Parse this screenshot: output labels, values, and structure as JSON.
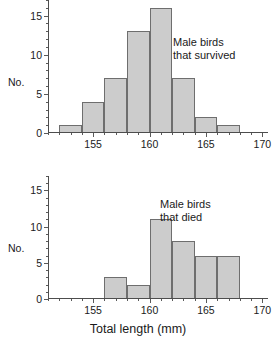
{
  "figure": {
    "xlabel": "Total length (mm)"
  },
  "chart_data": [
    {
      "type": "bar",
      "title": "",
      "annotation": [
        "Male birds",
        "that survived"
      ],
      "xlabel": "Total length (mm)",
      "ylabel": "No.",
      "xlim": [
        151.0,
        170.5
      ],
      "ylim": [
        0,
        17
      ],
      "grid": false,
      "legend": "none",
      "xticks": [
        155,
        160,
        165,
        170
      ],
      "xticklabels": [
        "155",
        "160",
        "165",
        "170"
      ],
      "xminor_step": 1,
      "yticks": [
        0,
        5,
        10,
        15
      ],
      "yticklabels": [
        "0",
        "5",
        "10",
        "15"
      ],
      "yminor_step": 1,
      "bin_width": 2,
      "bin_edges": [
        152,
        154,
        156,
        158,
        160,
        162,
        164,
        166,
        168
      ],
      "categories": [
        "152-154",
        "154-156",
        "156-158",
        "158-160",
        "160-162",
        "162-164",
        "164-166",
        "166-168"
      ],
      "values": [
        1,
        4,
        7,
        13,
        16,
        7,
        2,
        1
      ]
    },
    {
      "type": "bar",
      "title": "",
      "annotation": [
        "Male birds",
        "that died"
      ],
      "xlabel": "Total length (mm)",
      "ylabel": "No.",
      "xlim": [
        151.0,
        170.5
      ],
      "ylim": [
        0,
        17
      ],
      "grid": false,
      "legend": "none",
      "xticks": [
        155,
        160,
        165,
        170
      ],
      "xticklabels": [
        "155",
        "160",
        "165",
        "170"
      ],
      "xminor_step": 1,
      "yticks": [
        0,
        5,
        10,
        15
      ],
      "yticklabels": [
        "0",
        "5",
        "10",
        "15"
      ],
      "yminor_step": 1,
      "bin_width": 2,
      "bin_edges": [
        156,
        158,
        160,
        162,
        164,
        166,
        168
      ],
      "categories": [
        "156-158",
        "158-160",
        "160-162",
        "162-164",
        "164-166",
        "166-168"
      ],
      "values": [
        3,
        2,
        11,
        8,
        6,
        6
      ]
    }
  ]
}
